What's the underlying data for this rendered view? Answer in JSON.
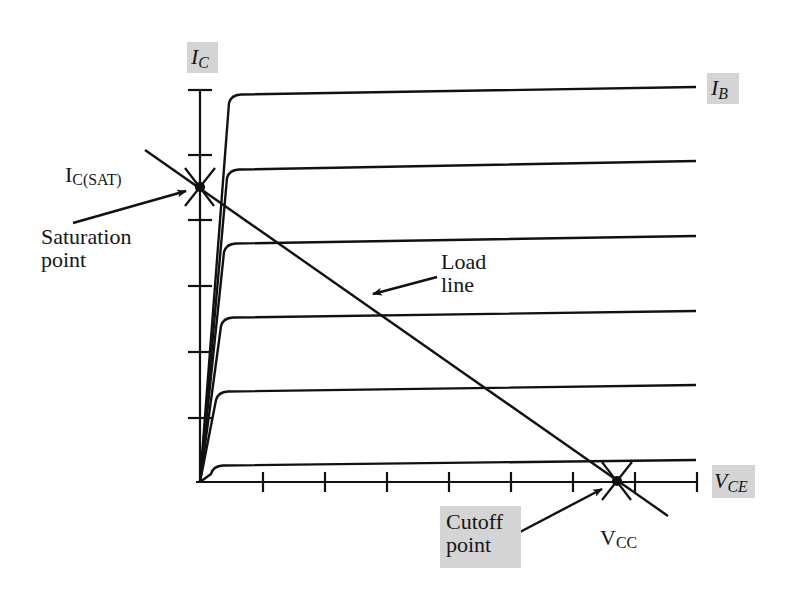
{
  "diagram": {
    "colors": {
      "line": "#111111",
      "label_box": "#d4d4d4",
      "background": "#ffffff"
    },
    "axes": {
      "y_label": {
        "main": "I",
        "sub": "C"
      },
      "x_label": {
        "main": "V",
        "sub": "CE"
      },
      "origin": [
        200,
        482
      ],
      "y_ticks_px": [
        90,
        155,
        220,
        286,
        352,
        418
      ],
      "x_ticks_px": [
        263,
        325,
        387,
        449,
        511,
        573,
        635,
        697
      ]
    },
    "curves_label": {
      "main": "I",
      "sub": "B"
    },
    "curves": [
      {
        "knee": [
          233,
          95
        ],
        "end": [
          696,
          87
        ]
      },
      {
        "knee": [
          231,
          170
        ],
        "end": [
          696,
          161
        ]
      },
      {
        "knee": [
          228,
          244
        ],
        "end": [
          696,
          236
        ]
      },
      {
        "knee": [
          225,
          318
        ],
        "end": [
          696,
          311
        ]
      },
      {
        "knee": [
          220,
          392
        ],
        "end": [
          696,
          385
        ]
      },
      {
        "knee": [
          215,
          466
        ],
        "end": [
          696,
          460
        ]
      }
    ],
    "load_line": {
      "start": [
        145,
        150
      ],
      "end": [
        668,
        516
      ],
      "label_line1": "Load",
      "label_line2": "line"
    },
    "saturation": {
      "point": [
        200,
        187
      ],
      "value_label": {
        "main": "I",
        "sub": "C(SAT)"
      },
      "label_line1": "Saturation",
      "label_line2": "point"
    },
    "cutoff": {
      "point": [
        617,
        481
      ],
      "value_label": {
        "main": "V",
        "sub": "CC"
      },
      "label_line1": "Cutoff",
      "label_line2": "point"
    }
  }
}
